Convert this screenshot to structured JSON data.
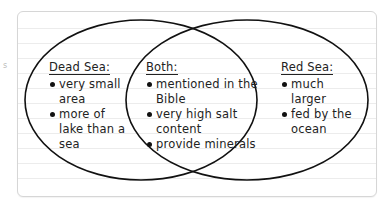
{
  "diagram": {
    "type": "venn",
    "left": {
      "title": "Dead Sea:",
      "items": [
        "very small area",
        "more of lake than a sea"
      ]
    },
    "center": {
      "title": "Both:",
      "items": [
        "mentioned in the Bible",
        "very high salt content",
        "provide minerals"
      ]
    },
    "right": {
      "title": "Red Sea:",
      "items": [
        "much larger",
        "fed by the ocean"
      ]
    }
  },
  "colors": {
    "stroke": "#111111",
    "text": "#222222",
    "rule_lines": "#ececec",
    "card_border": "#d6d6d6"
  }
}
